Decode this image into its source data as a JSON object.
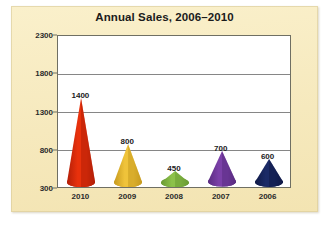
{
  "panel": {
    "background_color": "#f7ecc3"
  },
  "chart_data": {
    "type": "bar",
    "title": "Annual Sales, 2006–2010",
    "xlabel": "",
    "ylabel": "",
    "categories": [
      "2010",
      "2009",
      "2008",
      "2007",
      "2006"
    ],
    "values": [
      1400,
      800,
      450,
      700,
      600
    ],
    "data_labels": [
      "1400",
      "800",
      "450",
      "700",
      "600"
    ],
    "ylim": [
      300,
      2300
    ],
    "ytick_labels": [
      "300",
      "800",
      "1300",
      "1800",
      "2300"
    ],
    "ytick_values": [
      300,
      800,
      1300,
      1800,
      2300
    ],
    "grid": true,
    "grid_axis": "y",
    "legend": "none",
    "marker_style": "cone",
    "series_colors": [
      "#e8310c",
      "#efc33a",
      "#8cc14a",
      "#7b40a8",
      "#1b2a66"
    ],
    "series_colors_dark": [
      "#b31f08",
      "#c79a1f",
      "#6a9a33",
      "#5a2c81",
      "#101a47"
    ],
    "plot_background": "#ffffff",
    "axis_color": "#6f6f63",
    "gridline_color": "#868686"
  }
}
